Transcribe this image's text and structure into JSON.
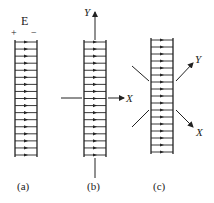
{
  "figure": {
    "stroke_color": "#222222",
    "background": "#ffffff",
    "panels": [
      {
        "id": "a",
        "caption": "(a)",
        "field_label": "E",
        "plate_signs": [
          "+",
          "−"
        ],
        "rungs": 17
      },
      {
        "id": "b",
        "caption": "(b)",
        "axes": [
          {
            "label": "Y",
            "direction": "up"
          },
          {
            "label": "X",
            "direction": "right"
          }
        ],
        "rungs": 17
      },
      {
        "id": "c",
        "caption": "(c)",
        "axes": [
          {
            "label": "Y",
            "direction": "up-right"
          },
          {
            "label": "X",
            "direction": "down-right"
          }
        ],
        "rungs": 17
      }
    ]
  }
}
